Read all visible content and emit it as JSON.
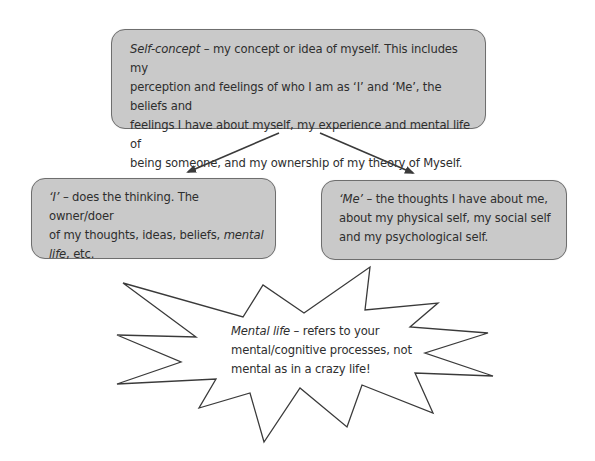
{
  "diagram": {
    "top_box": {
      "term": "Self-concept",
      "rest": " – my concept or idea of myself. This includes my perception and feelings of who I am as ‘I’ and ‘Me’, the beliefs and feelings I have about myself, my experience and mental life of being someone, and my ownership of my theory of Myself.",
      "lines": [
        "– my concept or idea of myself. This includes my",
        "perception and feelings of who I am as ‘I’ and ‘Me’, the beliefs and",
        "feelings I have about myself, my experience and mental life of",
        "being someone, and my ownership of my theory of Myself."
      ]
    },
    "left_box": {
      "term": "‘I’",
      "line1_rest": " – does the thinking. The owner/doer",
      "line2_plain": "of my thoughts, ideas, beliefs, ",
      "line2_em": "mental",
      "line3_em": "life",
      "line3_rest": ", etc."
    },
    "right_box": {
      "term": "‘Me’",
      "line1_rest": " – the thoughts I have about me,",
      "line2": "about my physical self, my social self",
      "line3": "and my psychological self."
    },
    "callout": {
      "term": "Mental life",
      "line1_rest": " – refers to your",
      "line2": "mental/cognitive processes, not",
      "line3": "mental as in a crazy life!"
    },
    "arrows": [
      {
        "from": "top_box",
        "to": "left_box",
        "label": "I"
      },
      {
        "from": "top_box",
        "to": "right_box",
        "label": "Me"
      }
    ],
    "colors": {
      "box_fill": "#c9c9c9",
      "box_border": "#6e6e6e",
      "text": "#2e2e2e",
      "arrow": "#3a3a3a",
      "burst_stroke": "#3a3a3a",
      "burst_fill": "#ffffff"
    }
  }
}
